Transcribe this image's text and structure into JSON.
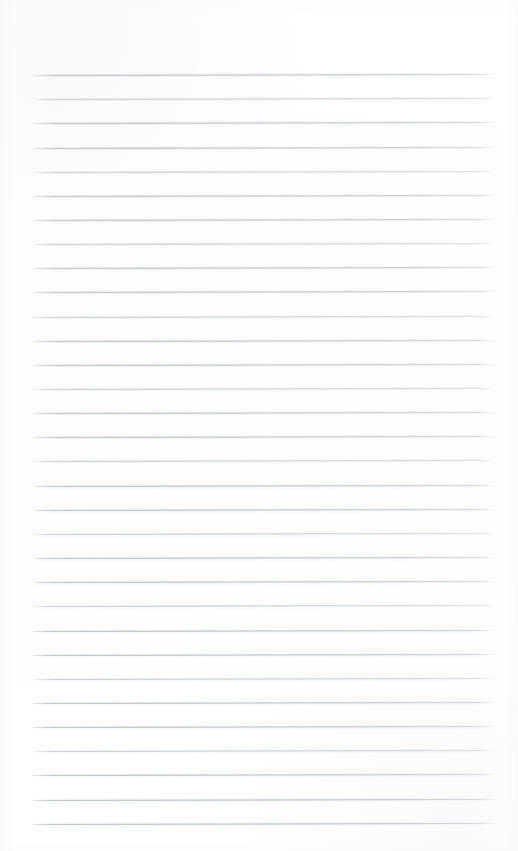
{
  "document": {
    "type": "blank-ruled-notepad-page",
    "title": "Blank Ruled Notepad Page",
    "written_content": "",
    "page_width": 518,
    "page_height": 851,
    "background_color": "#ffffff",
    "paper_tint": "#fdfdfe",
    "has_margin_rule": false,
    "has_header_text": false,
    "has_page_number": false,
    "has_handwriting": false
  },
  "ruling": {
    "line_color": "#b6bcc2",
    "line_thickness_px": 1,
    "line_count": 32,
    "line_spacing_px": 24.15,
    "first_line_y": 75,
    "last_line_y": 824,
    "left_x": 31,
    "right_x": 496,
    "line_length_px": 465,
    "skew_degrees": -0.12,
    "margins": {
      "top_px": 75,
      "bottom_px": 27,
      "left_px": 31,
      "right_px": 22
    },
    "lines": [
      {
        "index": 1,
        "y": 75.0,
        "weight": "strong"
      },
      {
        "index": 2,
        "y": 99.2,
        "weight": "faint"
      },
      {
        "index": 3,
        "y": 123.3,
        "weight": "strong"
      },
      {
        "index": 4,
        "y": 147.5,
        "weight": "strong"
      },
      {
        "index": 5,
        "y": 171.6,
        "weight": "faint"
      },
      {
        "index": 6,
        "y": 195.8,
        "weight": "strong"
      },
      {
        "index": 7,
        "y": 219.9,
        "weight": "strong"
      },
      {
        "index": 8,
        "y": 244.1,
        "weight": "faint"
      },
      {
        "index": 9,
        "y": 268.2,
        "weight": "strong"
      },
      {
        "index": 10,
        "y": 292.4,
        "weight": "strong"
      },
      {
        "index": 11,
        "y": 316.5,
        "weight": "faint"
      },
      {
        "index": 12,
        "y": 340.7,
        "weight": "strong"
      },
      {
        "index": 13,
        "y": 364.8,
        "weight": "strong"
      },
      {
        "index": 14,
        "y": 389.0,
        "weight": "faint"
      },
      {
        "index": 15,
        "y": 413.1,
        "weight": "strong"
      },
      {
        "index": 16,
        "y": 437.3,
        "weight": "strong"
      },
      {
        "index": 17,
        "y": 461.4,
        "weight": "faint"
      },
      {
        "index": 18,
        "y": 485.6,
        "weight": "strong"
      },
      {
        "index": 19,
        "y": 509.7,
        "weight": "strong"
      },
      {
        "index": 20,
        "y": 533.9,
        "weight": "faint"
      },
      {
        "index": 21,
        "y": 558.0,
        "weight": "strong"
      },
      {
        "index": 22,
        "y": 582.2,
        "weight": "strong"
      },
      {
        "index": 23,
        "y": 606.3,
        "weight": "faint"
      },
      {
        "index": 24,
        "y": 630.5,
        "weight": "strong"
      },
      {
        "index": 25,
        "y": 654.6,
        "weight": "strong"
      },
      {
        "index": 26,
        "y": 678.8,
        "weight": "faint"
      },
      {
        "index": 27,
        "y": 702.9,
        "weight": "strong"
      },
      {
        "index": 28,
        "y": 727.1,
        "weight": "strong"
      },
      {
        "index": 29,
        "y": 751.2,
        "weight": "faint"
      },
      {
        "index": 30,
        "y": 775.4,
        "weight": "strong"
      },
      {
        "index": 31,
        "y": 799.5,
        "weight": "strong"
      },
      {
        "index": 32,
        "y": 823.7,
        "weight": "strong"
      }
    ]
  }
}
